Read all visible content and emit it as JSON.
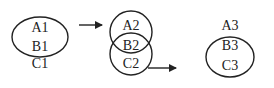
{
  "diagram": {
    "stage1": {
      "labels": [
        "A1",
        "B1",
        "C1"
      ]
    },
    "stage2": {
      "labels": [
        "A2",
        "B2",
        "C2"
      ]
    },
    "stage3": {
      "labels": [
        "A3",
        "B3",
        "C3"
      ]
    },
    "colors": {
      "stroke": "#222222",
      "background": "#ffffff"
    }
  }
}
